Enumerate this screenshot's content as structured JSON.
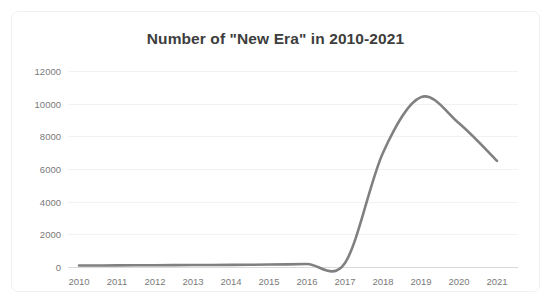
{
  "chart_data": {
    "type": "line",
    "title": "Number of \"New Era\" in 2010-2021",
    "xlabel": "",
    "ylabel": "",
    "categories": [
      "2010",
      "2011",
      "2012",
      "2013",
      "2014",
      "2015",
      "2016",
      "2017",
      "2018",
      "2019",
      "2020",
      "2021"
    ],
    "series": [
      {
        "name": "Number of \"New Era\"",
        "values": [
          90,
          100,
          110,
          120,
          130,
          150,
          180,
          250,
          7000,
          10400,
          8800,
          6500
        ]
      }
    ],
    "ylim": [
      0,
      12000
    ],
    "yticks": [
      0,
      2000,
      4000,
      6000,
      8000,
      10000,
      12000
    ],
    "ytick_labels": [
      "0",
      "2000",
      "4000",
      "6000",
      "8000",
      "10000",
      "12000"
    ],
    "grid": "horizontal",
    "legend": "none",
    "smooth": true,
    "markers": false,
    "line_color": "#808080",
    "title_color": "#3d3d3d",
    "tick_label_color": "#7a7a7a",
    "gridline_color": "#f2f2f2",
    "background_color": "#ffffff"
  }
}
